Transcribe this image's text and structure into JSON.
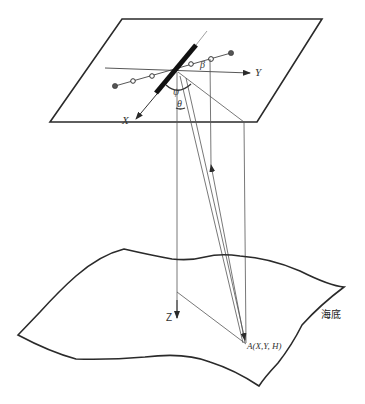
{
  "diagram": {
    "type": "multibeam-sonar-geometry",
    "labels": {
      "x_axis": "X",
      "y_axis": "Y",
      "z_axis": "Z",
      "beta": "β",
      "psi": "ψ",
      "theta": "θ",
      "point_a": "A(X,Y, H)",
      "seabed": "海底"
    },
    "colors": {
      "line": "#2a2a2a",
      "thin_line": "#555555",
      "background": "#ffffff"
    }
  }
}
